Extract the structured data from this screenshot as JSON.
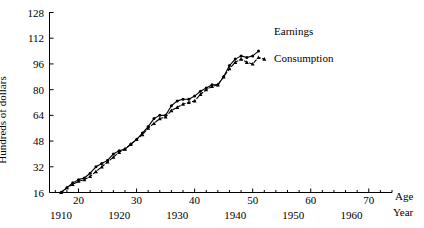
{
  "chart_data": {
    "type": "line",
    "title": "",
    "xlabel": "Age",
    "xlabel2": "Year",
    "ylabel": "Hundreds of dollars",
    "ylim": [
      16,
      128
    ],
    "xlim_age": [
      15,
      74
    ],
    "xlim_year": [
      1905,
      1964
    ],
    "grid": false,
    "legend_position": "right-inline",
    "y_ticks": [
      16,
      32,
      48,
      64,
      80,
      96,
      112,
      128
    ],
    "x_ticks_age": [
      20,
      30,
      40,
      50,
      60,
      70
    ],
    "x_ticks_year": [
      1910,
      1920,
      1930,
      1940,
      1950,
      1960
    ],
    "x_minor_tick_step": 2,
    "series": [
      {
        "name": "Earnings",
        "marker": "circle",
        "line_style": "solid",
        "x": [
          17,
          18,
          19,
          20,
          21,
          22,
          23,
          24,
          25,
          26,
          27,
          28,
          29,
          30,
          31,
          32,
          33,
          34,
          35,
          36,
          37,
          38,
          39,
          40,
          41,
          42,
          43,
          44,
          45,
          46,
          47,
          48,
          49,
          50,
          51
        ],
        "years": [
          1910,
          1911,
          1912,
          1913,
          1914,
          1915,
          1916,
          1917,
          1918,
          1919,
          1920,
          1921,
          1922,
          1923,
          1924,
          1925,
          1926,
          1927,
          1928,
          1929,
          1930,
          1931,
          1932,
          1933,
          1934,
          1935,
          1936,
          1937,
          1938,
          1939,
          1940,
          1941,
          1942,
          1943,
          1944
        ],
        "values": [
          16,
          19,
          22,
          24,
          25,
          28,
          32,
          34,
          36,
          40,
          42,
          43,
          46,
          49,
          53,
          57,
          62,
          64,
          64,
          70,
          73,
          74,
          74,
          76,
          79,
          81,
          83,
          83,
          88,
          95,
          99,
          101,
          100,
          101,
          104
        ]
      },
      {
        "name": "Consumption",
        "marker": "triangle",
        "line_style": "dashed",
        "x": [
          17,
          18,
          19,
          20,
          21,
          22,
          23,
          24,
          25,
          26,
          27,
          28,
          29,
          30,
          31,
          32,
          33,
          34,
          35,
          36,
          37,
          38,
          39,
          40,
          41,
          42,
          43,
          44,
          45,
          46,
          47,
          48,
          49,
          50,
          51,
          52
        ],
        "years": [
          1910,
          1911,
          1912,
          1913,
          1914,
          1915,
          1916,
          1917,
          1918,
          1919,
          1920,
          1921,
          1922,
          1923,
          1924,
          1925,
          1926,
          1927,
          1928,
          1929,
          1930,
          1931,
          1932,
          1933,
          1934,
          1935,
          1936,
          1937,
          1938,
          1939,
          1940,
          1941,
          1942,
          1943,
          1944,
          1945
        ],
        "values": [
          16,
          19,
          21,
          23,
          24,
          26,
          29,
          32,
          35,
          38,
          41,
          43,
          46,
          49,
          52,
          56,
          59,
          62,
          63,
          67,
          69,
          71,
          72,
          73,
          77,
          80,
          82,
          83,
          88,
          93,
          97,
          99,
          97,
          96,
          100,
          99
        ]
      }
    ],
    "annotations": [
      {
        "text": "Earnings",
        "x": 53,
        "y": 116
      },
      {
        "text": "Consumption",
        "x": 53,
        "y": 99
      }
    ]
  }
}
